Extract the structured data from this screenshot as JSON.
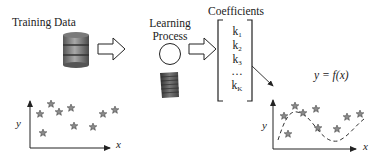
{
  "stages": {
    "training_data": {
      "label": "Training Data"
    },
    "learning_process": {
      "label_line1": "Learning",
      "label_line2": "Process"
    },
    "coefficients": {
      "label": "Coefficients",
      "items": [
        {
          "base": "k",
          "sub": "1"
        },
        {
          "base": "k",
          "sub": "2"
        },
        {
          "base": "k",
          "sub": "3"
        },
        {
          "base": "…",
          "sub": ""
        },
        {
          "base": "k",
          "sub": "K"
        }
      ]
    }
  },
  "input_plot": {
    "x_label": "x",
    "y_label": "y"
  },
  "output_plot": {
    "x_label": "x",
    "y_label": "y",
    "equation": "y = f(x)"
  },
  "colors": {
    "stroke": "#222222",
    "star_fill": "#8a8a8a",
    "database_dark": "#4a4a4a",
    "database_light": "#b0b0b0",
    "server": "#555555"
  }
}
